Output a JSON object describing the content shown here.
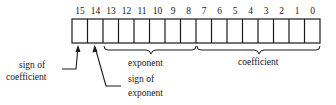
{
  "diagram": {
    "bit_numbers": [
      "15",
      "14",
      "13",
      "12",
      "11",
      "10",
      "9",
      "8",
      "7",
      "6",
      "5",
      "4",
      "3",
      "2",
      "1",
      "0"
    ],
    "labels": {
      "sign_of_coefficient_line1": "sign of",
      "sign_of_coefficient_line2": "coefficient",
      "sign_of_exponent_line1": "sign of",
      "sign_of_exponent_line2": "exponent",
      "exponent": "exponent",
      "coefficient": "coefficient"
    },
    "fields": [
      {
        "name": "sign of coefficient",
        "bits": [
          15
        ]
      },
      {
        "name": "sign of exponent",
        "bits": [
          14
        ]
      },
      {
        "name": "exponent",
        "bits": [
          13,
          8
        ]
      },
      {
        "name": "coefficient",
        "bits": [
          7,
          0
        ]
      }
    ]
  }
}
